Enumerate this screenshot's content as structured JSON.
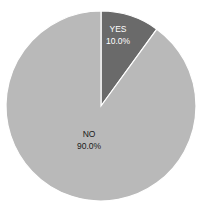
{
  "chart_data": {
    "type": "pie",
    "title": "",
    "categories": [
      "YES",
      "NO"
    ],
    "values": [
      10.0,
      90.0
    ],
    "labels": [
      "10.0%",
      "90.0%"
    ],
    "colors": [
      "#6a6a6a",
      "#b9b9b9"
    ],
    "start_angle": "12 o'clock, clockwise",
    "legend": "none"
  },
  "slices": [
    {
      "name": "YES",
      "pct": "10.0%",
      "color": "#6a6a6a",
      "text_color": "#ffffff"
    },
    {
      "name": "NO",
      "pct": "90.0%",
      "color": "#b9b9b9",
      "text_color": "#1a1a1a"
    }
  ]
}
